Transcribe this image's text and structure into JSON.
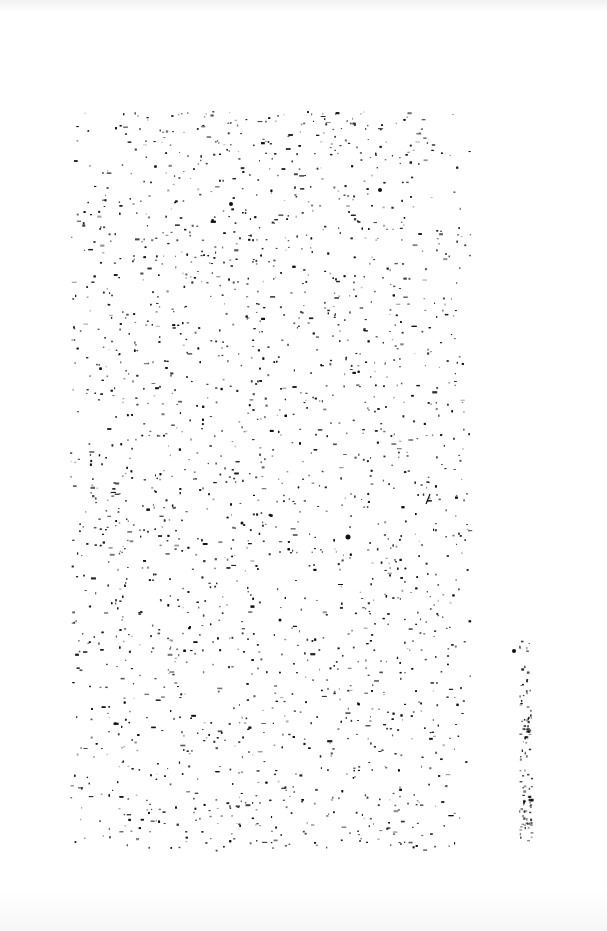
{
  "page": {
    "type": "scanned-blank-page",
    "text": "",
    "background_color": "#ffffff",
    "ink_color": "#111111"
  },
  "noise": {
    "main_region": {
      "x": 70,
      "y": 110,
      "w": 400,
      "h": 740,
      "density": 4200
    },
    "edge_strip": {
      "x": 515,
      "y": 640,
      "w": 20,
      "h": 200,
      "density": 160
    },
    "marks": [
      {
        "x": 231,
        "y": 204,
        "r": 2
      },
      {
        "x": 380,
        "y": 190,
        "r": 2
      },
      {
        "x": 348,
        "y": 537,
        "r": 2.5
      },
      {
        "x": 242,
        "y": 523,
        "r": 1.5
      },
      {
        "x": 514,
        "y": 651,
        "r": 2
      },
      {
        "x": 280,
        "y": 620,
        "r": 1.5
      }
    ],
    "slash": {
      "x1": 426,
      "y1": 504,
      "x2": 430,
      "y2": 494
    }
  }
}
